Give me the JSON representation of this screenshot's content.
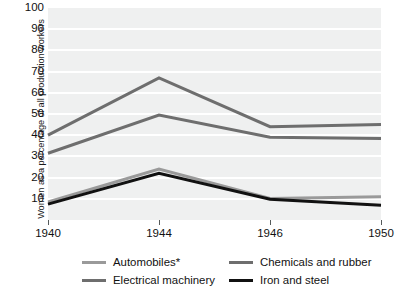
{
  "chart_data": {
    "type": "line",
    "title": "",
    "xlabel": "",
    "ylabel": "Women as a percentage of all production workers",
    "categories": [
      "1940",
      "1944",
      "1946",
      "1950"
    ],
    "x_tick_labels": [
      "1940",
      "1944",
      "1946",
      "1950"
    ],
    "y_tick_labels": [
      "100",
      "90",
      "80",
      "70",
      "60",
      "50",
      "40",
      "30",
      "20",
      "10"
    ],
    "ylim": [
      0,
      100
    ],
    "y_tick_step": 10,
    "grid": true,
    "grid_axis": "y",
    "grid_color": "#ffffff",
    "plot_background": "#eff0f0",
    "legend_position": "bottom",
    "series": [
      {
        "name": "Automobiles*",
        "color": "#9a9a9a",
        "values": [
          8.5,
          24.0,
          10.2,
          11.0
        ]
      },
      {
        "name": "Electrical machinery",
        "color": "#6e6e6e",
        "values": [
          31.5,
          49.5,
          39.0,
          38.5
        ]
      },
      {
        "name": "Chemicals and rubber",
        "color": "#6e6e6e",
        "values": [
          40.0,
          67.0,
          44.0,
          45.0
        ]
      },
      {
        "name": "Iron and steel",
        "color": "#111111",
        "values": [
          7.5,
          22.0,
          9.8,
          7.0
        ]
      }
    ]
  },
  "legend": {
    "items": [
      {
        "label": "Automobiles*",
        "color": "#9a9a9a"
      },
      {
        "label": "Electrical machinery",
        "color": "#6e6e6e"
      },
      {
        "label": "Chemicals and rubber",
        "color": "#6e6e6e"
      },
      {
        "label": "Iron and steel",
        "color": "#111111"
      }
    ]
  }
}
